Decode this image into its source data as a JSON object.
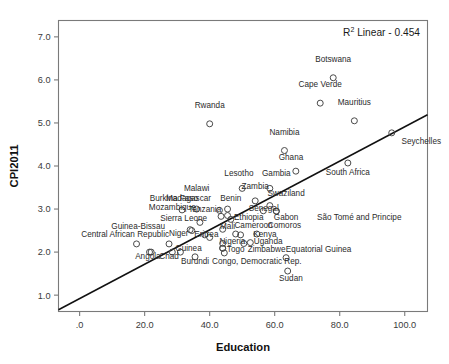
{
  "chart_data": {
    "type": "scatter",
    "title": "",
    "xlabel": "Education",
    "ylabel": "CPI2011",
    "xlim": [
      -6.5,
      107.0
    ],
    "ylim": [
      0.62,
      7.38
    ],
    "grid": false,
    "xticks": [
      0,
      20,
      40,
      60,
      80,
      100
    ],
    "xticklabels": [
      ".0",
      "20.0",
      "40.0",
      "60.0",
      "80.0",
      "100.0"
    ],
    "yticks": [
      1.0,
      2.0,
      3.0,
      4.0,
      5.0,
      6.0,
      7.0
    ],
    "yticklabels": [
      "1.0",
      "2.0",
      "3.0",
      "4.0",
      "5.0",
      "6.0",
      "7.0"
    ],
    "annotation": {
      "text_prefix": "R",
      "text_sup": "2",
      "text_suffix": " Linear - 0.454",
      "r_squared": 0.454,
      "full_text": "R² Linear - 0.454"
    },
    "fit_line": {
      "type": "linear",
      "x_start": -6.5,
      "y_start": 0.66,
      "x_end": 107.0,
      "y_end": 5.19
    },
    "points": [
      {
        "label": "Botswana",
        "x": 78.0,
        "y": 6.05,
        "lx": 78.0,
        "ly": 6.42,
        "anchor": "middle"
      },
      {
        "label": "Cape Verde",
        "x": 74.0,
        "y": 5.46,
        "lx": 74.0,
        "ly": 5.83,
        "anchor": "middle"
      },
      {
        "label": "Mauritius",
        "x": 84.5,
        "y": 5.05,
        "lx": 84.5,
        "ly": 5.42,
        "anchor": "middle"
      },
      {
        "label": "Seychelles",
        "x": 96.0,
        "y": 4.77,
        "lx": 99.0,
        "ly": 4.5,
        "anchor": "start"
      },
      {
        "label": "Rwanda",
        "x": 40.0,
        "y": 4.98,
        "lx": 40.0,
        "ly": 5.35,
        "anchor": "middle"
      },
      {
        "label": "Namibia",
        "x": 63.0,
        "y": 4.36,
        "lx": 63.0,
        "ly": 4.73,
        "anchor": "middle"
      },
      {
        "label": "South Africa",
        "x": 82.5,
        "y": 4.07,
        "lx": 82.5,
        "ly": 3.8,
        "anchor": "middle"
      },
      {
        "label": "Ghana",
        "x": 66.5,
        "y": 3.88,
        "lx": 65.0,
        "ly": 4.15,
        "anchor": "middle"
      },
      {
        "label": "Lesotho",
        "x": 50.0,
        "y": 3.48,
        "lx": 49.0,
        "ly": 3.76,
        "anchor": "middle"
      },
      {
        "label": "Gambia",
        "x": 58.5,
        "y": 3.48,
        "lx": 60.5,
        "ly": 3.76,
        "anchor": "middle"
      },
      {
        "label": "Zambia",
        "x": 54.0,
        "y": 3.19,
        "lx": 54.0,
        "ly": 3.47,
        "anchor": "middle"
      },
      {
        "label": "Swaziland",
        "x": 58.5,
        "y": 3.08,
        "lx": 63.5,
        "ly": 3.3,
        "anchor": "middle"
      },
      {
        "label": "Malawi",
        "x": 36.0,
        "y": 3.0,
        "lx": 36.0,
        "ly": 3.42,
        "anchor": "middle"
      },
      {
        "label": "Madagascar",
        "x": 31.5,
        "y": 2.98,
        "lx": 33.5,
        "ly": 3.19,
        "anchor": "middle"
      },
      {
        "label": "Benin",
        "x": 45.5,
        "y": 3.0,
        "lx": 46.5,
        "ly": 3.19,
        "anchor": "middle"
      },
      {
        "label": "Burkina Faso",
        "x": 43.0,
        "y": 2.97,
        "lx": 29.0,
        "ly": 3.19,
        "anchor": "middle"
      },
      {
        "label": "Senegal",
        "x": 56.5,
        "y": 2.96,
        "lx": 52.0,
        "ly": 2.96,
        "anchor": "start"
      },
      {
        "label": "Mozambique",
        "x": 43.5,
        "y": 2.83,
        "lx": 28.5,
        "ly": 2.97,
        "anchor": "middle"
      },
      {
        "label": "Tanzania",
        "x": 37.0,
        "y": 2.69,
        "lx": 38.5,
        "ly": 2.93,
        "anchor": "middle"
      },
      {
        "label": "Ethiopia",
        "x": 46.5,
        "y": 2.76,
        "lx": 52.0,
        "ly": 2.74,
        "anchor": "middle"
      },
      {
        "label": "Gabon",
        "x": 60.5,
        "y": 2.95,
        "lx": 63.5,
        "ly": 2.74,
        "anchor": "middle"
      },
      {
        "label": "São Tomé and Principe",
        "x": 60.5,
        "y": 2.95,
        "lx": 86.0,
        "ly": 2.74,
        "anchor": "middle"
      },
      {
        "label": "Sierra Leone",
        "x": 34.0,
        "y": 2.52,
        "lx": 32.0,
        "ly": 2.73,
        "anchor": "middle"
      },
      {
        "label": "Guinea-Bissau",
        "x": 22.0,
        "y": 2.0,
        "lx": 18.0,
        "ly": 2.54,
        "anchor": "middle"
      },
      {
        "label": "Mali",
        "x": 44.0,
        "y": 2.53,
        "lx": 45.5,
        "ly": 2.54,
        "anchor": "middle"
      },
      {
        "label": "Cameroon",
        "x": 48.0,
        "y": 2.42,
        "lx": 53.5,
        "ly": 2.55,
        "anchor": "middle"
      },
      {
        "label": "Comoros",
        "x": 54.5,
        "y": 2.42,
        "lx": 63.0,
        "ly": 2.55,
        "anchor": "middle"
      },
      {
        "label": "Central African Republic",
        "x": 17.5,
        "y": 2.19,
        "lx": 14.0,
        "ly": 2.36,
        "anchor": "middle"
      },
      {
        "label": "Niger",
        "x": 34.5,
        "y": 2.5,
        "lx": 30.5,
        "ly": 2.37,
        "anchor": "middle"
      },
      {
        "label": "Eritrea",
        "x": 38.5,
        "y": 2.4,
        "lx": 39.0,
        "ly": 2.36,
        "anchor": "middle"
      },
      {
        "label": "Kenya",
        "x": 50.5,
        "y": 2.2,
        "lx": 57.0,
        "ly": 2.35,
        "anchor": "middle"
      },
      {
        "label": "Nigeria",
        "x": 44.0,
        "y": 2.2,
        "lx": 47.0,
        "ly": 2.18,
        "anchor": "middle"
      },
      {
        "label": "Uganda",
        "x": 52.5,
        "y": 2.22,
        "lx": 58.0,
        "ly": 2.18,
        "anchor": "middle"
      },
      {
        "label": "Guinea",
        "x": 31.0,
        "y": 2.0,
        "lx": 33.5,
        "ly": 2.02,
        "anchor": "middle"
      },
      {
        "label": "Togo",
        "x": 44.0,
        "y": 2.09,
        "lx": 48.0,
        "ly": 2.01,
        "anchor": "middle"
      },
      {
        "label": "Zimbabwe",
        "x": 44.0,
        "y": 2.09,
        "lx": 57.5,
        "ly": 2.01,
        "anchor": "middle"
      },
      {
        "label": "Equatorial Guinea",
        "x": 63.5,
        "y": 1.87,
        "lx": 73.5,
        "ly": 2.01,
        "anchor": "middle"
      },
      {
        "label": "Angola",
        "x": 21.5,
        "y": 2.0,
        "lx": 21.0,
        "ly": 1.83,
        "anchor": "middle"
      },
      {
        "label": "Chad",
        "x": 27.5,
        "y": 2.19,
        "lx": 27.5,
        "ly": 1.83,
        "anchor": "middle"
      },
      {
        "label": "Burundi",
        "x": 35.5,
        "y": 1.89,
        "lx": 35.5,
        "ly": 1.72,
        "anchor": "middle"
      },
      {
        "label": "Congo, Democratic Rep.",
        "x": 44.5,
        "y": 1.98,
        "lx": 54.5,
        "ly": 1.72,
        "anchor": "middle"
      },
      {
        "label": "Sudan",
        "x": 64.0,
        "y": 1.56,
        "lx": 65.0,
        "ly": 1.33,
        "anchor": "middle"
      }
    ],
    "extra_markers": [
      {
        "x": 28.5,
        "y": 2.0
      },
      {
        "x": 45.5,
        "y": 2.85
      },
      {
        "x": 49.5,
        "y": 2.4
      },
      {
        "x": 40.0,
        "y": 2.34
      }
    ]
  }
}
